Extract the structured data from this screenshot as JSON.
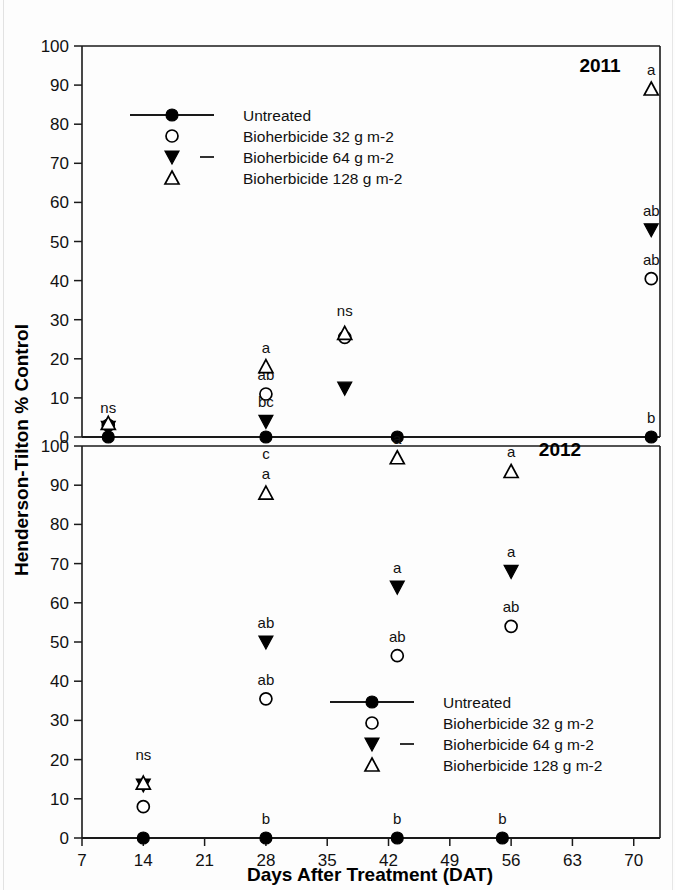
{
  "figure": {
    "y_axis_title": "Henderson-Tilton % Control",
    "x_axis_title": "Days After Treatment (DAT)",
    "panel_top_label": "2011",
    "panel_bottom_label": "2012"
  },
  "legend": {
    "items": [
      {
        "label": "Untreated",
        "marker": "filled-circle-with-line"
      },
      {
        "label": "Bioherbicide 32 g m-2",
        "marker": "open-circle"
      },
      {
        "label": "Bioherbicide 64 g m-2",
        "marker": "filled-triangle-down-with-dash"
      },
      {
        "label": "Bioherbicide 128 g m-2",
        "marker": "open-triangle-up"
      }
    ]
  },
  "chart_data": {
    "type": "scatter",
    "title": "",
    "xlabel": "Days After Treatment (DAT)",
    "ylabel": "Henderson-Tilton % Control",
    "xlim": [
      7,
      73
    ],
    "xticks": [
      7,
      14,
      21,
      28,
      35,
      42,
      49,
      56,
      63,
      70
    ],
    "grid": false,
    "legend_position": "inside",
    "panels": [
      {
        "name": "2011",
        "ylim": [
          0,
          100
        ],
        "yticks": [
          0,
          10,
          20,
          30,
          40,
          50,
          60,
          70,
          80,
          90,
          100
        ],
        "series": [
          {
            "name": "Untreated",
            "marker": "filled-circle",
            "points": [
              {
                "x": 10,
                "y": 0,
                "letter": ""
              },
              {
                "x": 28,
                "y": 0,
                "letter": "c"
              },
              {
                "x": 43,
                "y": 0,
                "letter": ""
              },
              {
                "x": 72,
                "y": 0,
                "letter": "b"
              }
            ]
          },
          {
            "name": "Bioherbicide 32 g m-2",
            "marker": "open-circle",
            "points": [
              {
                "x": 10,
                "y": 3,
                "letter": ""
              },
              {
                "x": 28,
                "y": 11,
                "letter": "ab"
              },
              {
                "x": 37,
                "y": 25.5,
                "letter": ""
              },
              {
                "x": 72,
                "y": 40.5,
                "letter": "ab"
              }
            ]
          },
          {
            "name": "Bioherbicide 64 g m-2",
            "marker": "filled-triangle-down",
            "points": [
              {
                "x": 10,
                "y": 2.5,
                "letter": ""
              },
              {
                "x": 28,
                "y": 4,
                "letter": "bc"
              },
              {
                "x": 37,
                "y": 12.5,
                "letter": ""
              },
              {
                "x": 72,
                "y": 53,
                "letter": "ab"
              }
            ]
          },
          {
            "name": "Bioherbicide 128 g m-2",
            "marker": "open-triangle-up",
            "points": [
              {
                "x": 10,
                "y": 3.5,
                "letter": ""
              },
              {
                "x": 28,
                "y": 18,
                "letter": "a"
              },
              {
                "x": 37,
                "y": 26.5,
                "letter": ""
              },
              {
                "x": 72,
                "y": 89,
                "letter": "a"
              }
            ]
          }
        ],
        "group_annotations": [
          {
            "x": 10,
            "y": 5,
            "text": "ns"
          },
          {
            "x": 37,
            "y": 30,
            "text": "ns"
          }
        ]
      },
      {
        "name": "2012",
        "ylim": [
          0,
          100
        ],
        "yticks": [
          0,
          10,
          20,
          30,
          40,
          50,
          60,
          70,
          80,
          90,
          100
        ],
        "series": [
          {
            "name": "Untreated",
            "marker": "filled-circle",
            "points": [
              {
                "x": 14,
                "y": 0,
                "letter": ""
              },
              {
                "x": 28,
                "y": 0,
                "letter": "b"
              },
              {
                "x": 43,
                "y": 0,
                "letter": "b"
              },
              {
                "x": 55,
                "y": 0,
                "letter": "b"
              }
            ]
          },
          {
            "name": "Bioherbicide 32 g m-2",
            "marker": "open-circle",
            "points": [
              {
                "x": 14,
                "y": 8,
                "letter": ""
              },
              {
                "x": 28,
                "y": 35.5,
                "letter": "ab"
              },
              {
                "x": 43,
                "y": 46.5,
                "letter": "ab"
              },
              {
                "x": 56,
                "y": 54,
                "letter": "ab"
              }
            ]
          },
          {
            "name": "Bioherbicide 64 g m-2",
            "marker": "filled-triangle-down",
            "points": [
              {
                "x": 14,
                "y": 13.5,
                "letter": ""
              },
              {
                "x": 28,
                "y": 50,
                "letter": "ab"
              },
              {
                "x": 43,
                "y": 64,
                "letter": "a"
              },
              {
                "x": 56,
                "y": 68,
                "letter": "a"
              }
            ]
          },
          {
            "name": "Bioherbicide 128 g m-2",
            "marker": "open-triangle-up",
            "points": [
              {
                "x": 14,
                "y": 14,
                "letter": ""
              },
              {
                "x": 28,
                "y": 88,
                "letter": "a"
              },
              {
                "x": 43,
                "y": 97,
                "letter": "a"
              },
              {
                "x": 56,
                "y": 93.5,
                "letter": "a"
              }
            ]
          }
        ],
        "group_annotations": [
          {
            "x": 14,
            "y": 19,
            "text": "ns"
          }
        ]
      }
    ]
  }
}
